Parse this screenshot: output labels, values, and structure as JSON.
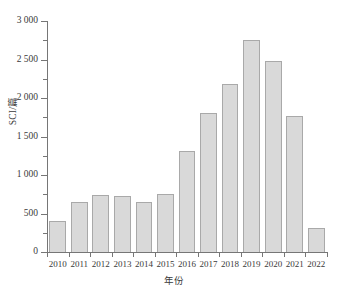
{
  "chart_data": {
    "type": "bar",
    "title": "",
    "xlabel": "年份",
    "ylabel": "SCI/篇",
    "categories": [
      "2010",
      "2011",
      "2012",
      "2013",
      "2014",
      "2015",
      "2016",
      "2017",
      "2018",
      "2019",
      "2020",
      "2021",
      "2022"
    ],
    "values": [
      400,
      645,
      740,
      725,
      650,
      755,
      1310,
      1805,
      2180,
      2750,
      2480,
      1765,
      310
    ],
    "series": [
      {
        "name": "SCI",
        "values": [
          400,
          645,
          740,
          725,
          650,
          755,
          1310,
          1805,
          2180,
          2750,
          2480,
          1765,
          310
        ]
      }
    ],
    "ylim": [
      0,
      3000
    ],
    "ytick_values": [
      0,
      500,
      1000,
      1500,
      2000,
      2500,
      3000
    ],
    "ytick_labels": [
      "0",
      "500",
      "1 000",
      "1 500",
      "2 000",
      "2 500",
      "3 000"
    ],
    "yminor_tick_values": [
      250,
      750,
      1250,
      1750,
      2250,
      2750
    ],
    "grid": false,
    "legend": false,
    "bar_fill_color": "#d9d9d9",
    "bar_border_color": "#a9a9a9",
    "axis_color": "#767676"
  },
  "axes": {
    "y_title": "SCI/篇",
    "x_title": "年份"
  }
}
